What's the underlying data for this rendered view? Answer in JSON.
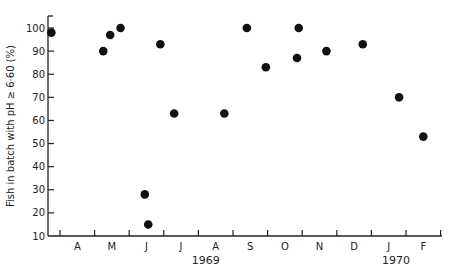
{
  "chart_data": {
    "type": "scatter",
    "title": "",
    "xlabel": "",
    "ylabel": "Fish in batch with pH ≥ 6·60 (%)",
    "ylim": [
      10,
      100
    ],
    "yticks": [
      10,
      20,
      30,
      40,
      50,
      60,
      70,
      80,
      90,
      100
    ],
    "grid": false,
    "legend": null,
    "x_months": [
      "A",
      "M",
      "J",
      "J",
      "A",
      "S",
      "O",
      "N",
      "D",
      "J",
      "F"
    ],
    "x_years": [
      {
        "label": "1969",
        "under_month_index": 4
      },
      {
        "label": "1970",
        "under_month_index": 9.5
      }
    ],
    "x_unit": "month index (0 = start of April 1969; 11 = end of Feb 1970)",
    "points": [
      {
        "x": -0.25,
        "y": 98
      },
      {
        "x": 1.25,
        "y": 90
      },
      {
        "x": 1.45,
        "y": 97
      },
      {
        "x": 1.75,
        "y": 100
      },
      {
        "x": 2.45,
        "y": 28
      },
      {
        "x": 2.55,
        "y": 15
      },
      {
        "x": 2.9,
        "y": 93
      },
      {
        "x": 3.3,
        "y": 63
      },
      {
        "x": 4.75,
        "y": 63
      },
      {
        "x": 5.4,
        "y": 100
      },
      {
        "x": 5.95,
        "y": 83
      },
      {
        "x": 6.85,
        "y": 87
      },
      {
        "x": 6.9,
        "y": 100
      },
      {
        "x": 7.7,
        "y": 90
      },
      {
        "x": 8.75,
        "y": 93
      },
      {
        "x": 9.8,
        "y": 70
      },
      {
        "x": 10.5,
        "y": 53
      }
    ]
  }
}
